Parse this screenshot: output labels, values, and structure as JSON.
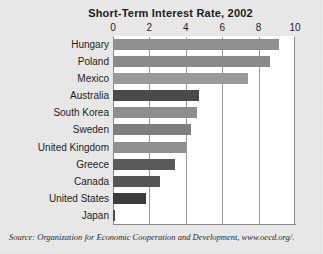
{
  "chart_data": {
    "type": "bar",
    "orientation": "horizontal",
    "title": "Short-Term Interest Rate, 2002",
    "xlabel": "",
    "ylabel": "",
    "xlim": [
      0,
      10
    ],
    "ticks": [
      0,
      2,
      4,
      6,
      8,
      10
    ],
    "grid": true,
    "legend": "none",
    "categories": [
      "Hungary",
      "Poland",
      "Mexico",
      "Australia",
      "South Korea",
      "Sweden",
      "United Kingdom",
      "Greece",
      "Canada",
      "United States",
      "Japan"
    ],
    "values": [
      9.1,
      8.6,
      7.4,
      4.7,
      4.6,
      4.3,
      4.0,
      3.4,
      2.6,
      1.8,
      0.1
    ],
    "bar_colors": [
      "#8f8f8f",
      "#8a8a8a",
      "#9a9a9a",
      "#4a4a4a",
      "#8e8e8e",
      "#7e7e7e",
      "#909090",
      "#5a5a5a",
      "#555555",
      "#3c3c3c",
      "#4a4a4a"
    ],
    "source": "Source: Organization for Economic Cooperation and Development, www.oecd.org/."
  },
  "colors": {
    "page_background": "#e9e9e9",
    "plot_background": "#ffffff",
    "gridline": "#9a9a9a",
    "text": "#1c1c1c"
  }
}
